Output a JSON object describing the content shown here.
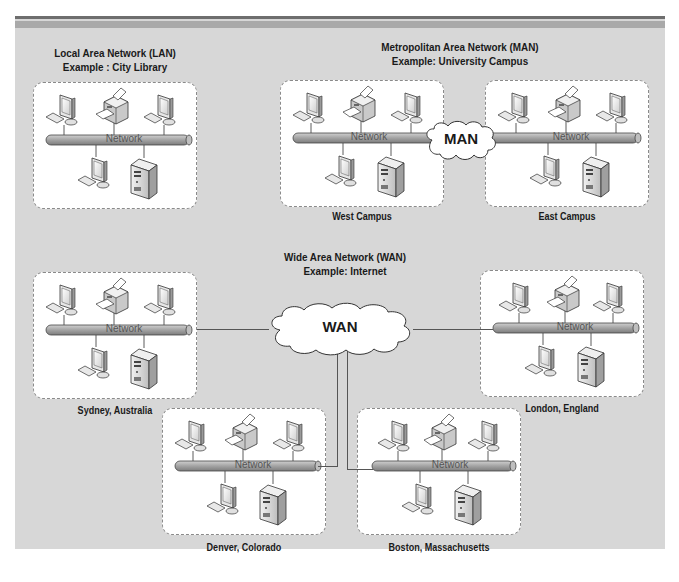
{
  "diagram": {
    "type": "network-topology-comparison",
    "colors": {
      "panel_bg": "#d7d7d7",
      "box_bg": "#ffffff",
      "box_border": "#8a8a8a",
      "network_bus": "#a8a8a8",
      "wire": "#555555"
    },
    "lan": {
      "title": "Local Area Network (LAN)",
      "example": "Example : City Library",
      "network_label": "Network"
    },
    "man": {
      "title": "Metropolitan Area Network (MAN)",
      "example": "Example: University Campus",
      "cloud_label": "MAN",
      "sites": [
        {
          "name": "West Campus",
          "network_label": "Network"
        },
        {
          "name": "East Campus",
          "network_label": "Network"
        }
      ]
    },
    "wan": {
      "title": "Wide Area Network (WAN)",
      "example": "Example: Internet",
      "cloud_label": "WAN",
      "sites": [
        {
          "name": "Sydney,  Australia",
          "network_label": "Network"
        },
        {
          "name": "London,  England",
          "network_label": "Network"
        },
        {
          "name": "Denver,  Colorado",
          "network_label": "Network"
        },
        {
          "name": "Boston,  Massachusetts",
          "network_label": "Network"
        }
      ]
    },
    "devices_per_network": [
      "workstation",
      "printer",
      "workstation",
      "workstation",
      "server"
    ]
  }
}
